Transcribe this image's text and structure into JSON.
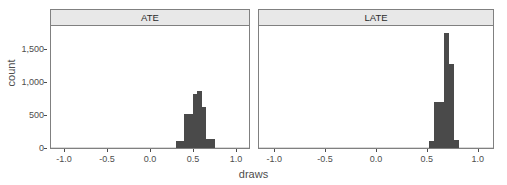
{
  "chart_data": {
    "type": "bar",
    "title": "",
    "xlabel": "draws",
    "ylabel": "count",
    "xlim": [
      -1.15,
      1.15
    ],
    "ylim": [
      0,
      1850
    ],
    "grid": false,
    "legend": null,
    "facet_variable": "estimand",
    "x_ticks": [
      {
        "value": -1.0,
        "label": "-1.0"
      },
      {
        "value": -0.5,
        "label": "-0.5"
      },
      {
        "value": 0.0,
        "label": "0.0"
      },
      {
        "value": 0.5,
        "label": "0.5"
      },
      {
        "value": 1.0,
        "label": "1.0"
      }
    ],
    "y_ticks": [
      {
        "value": 0,
        "label": "0"
      },
      {
        "value": 500,
        "label": "500"
      },
      {
        "value": 1000,
        "label": "1,000"
      },
      {
        "value": 1500,
        "label": "1,500"
      }
    ],
    "panels": [
      {
        "label": "ATE",
        "bin_width": 0.05,
        "bins": [
          {
            "x0": 0.3,
            "x1": 0.35,
            "count": 100
          },
          {
            "x0": 0.35,
            "x1": 0.4,
            "count": 110
          },
          {
            "x0": 0.4,
            "x1": 0.45,
            "count": 520
          },
          {
            "x0": 0.45,
            "x1": 0.5,
            "count": 520
          },
          {
            "x0": 0.5,
            "x1": 0.55,
            "count": 820
          },
          {
            "x0": 0.55,
            "x1": 0.6,
            "count": 870
          },
          {
            "x0": 0.6,
            "x1": 0.65,
            "count": 620
          },
          {
            "x0": 0.65,
            "x1": 0.7,
            "count": 130
          },
          {
            "x0": 0.7,
            "x1": 0.75,
            "count": 130
          }
        ]
      },
      {
        "label": "LATE",
        "bin_width": 0.05,
        "bins": [
          {
            "x0": 0.52,
            "x1": 0.57,
            "count": 110
          },
          {
            "x0": 0.57,
            "x1": 0.62,
            "count": 700
          },
          {
            "x0": 0.62,
            "x1": 0.67,
            "count": 700
          },
          {
            "x0": 0.67,
            "x1": 0.72,
            "count": 1750
          },
          {
            "x0": 0.72,
            "x1": 0.77,
            "count": 1280
          },
          {
            "x0": 0.77,
            "x1": 0.82,
            "count": 120
          }
        ]
      }
    ],
    "colors": {
      "bar_fill": "#4a4a4a",
      "panel_border": "#808080",
      "strip_background": "#e8e8e8",
      "text": "#4d4d4d",
      "background": "#ffffff"
    }
  }
}
